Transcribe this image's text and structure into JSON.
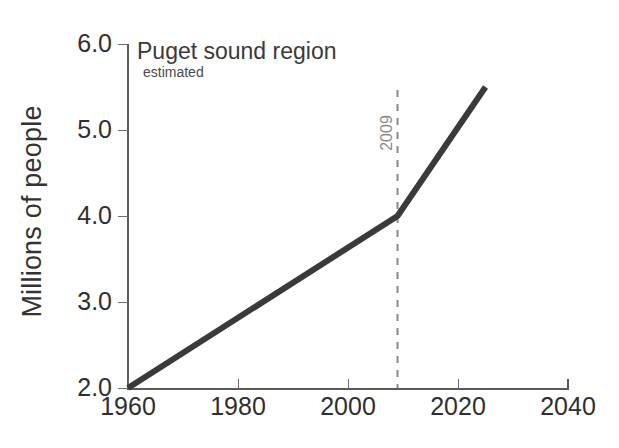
{
  "chart_data": {
    "type": "line",
    "title": "Puget sound region",
    "subtitle": "estimated",
    "xlabel": "",
    "ylabel": "Millions of people",
    "xlim": [
      1960,
      2040
    ],
    "ylim": [
      2.0,
      6.0
    ],
    "grid": false,
    "legend": null,
    "xticks": [
      1960,
      1980,
      2000,
      2020,
      2040
    ],
    "xtick_labels": [
      "1960",
      "1980",
      "2000",
      "2020",
      "2040"
    ],
    "yticks": [
      2.0,
      3.0,
      4.0,
      5.0,
      6.0
    ],
    "ytick_labels": [
      "2.0",
      "3.0",
      "4.0",
      "5.0",
      "6.0"
    ],
    "series": [
      {
        "name": "Puget sound region population",
        "color": "#3a3a3a",
        "x": [
          1960,
          2009,
          2025
        ],
        "values": [
          2.0,
          4.0,
          5.5
        ]
      }
    ],
    "annotations": [
      {
        "type": "vline",
        "label": "2009",
        "x": 2009,
        "style": "dashed",
        "color": "#8a8a8a",
        "orientation": "vertical-text"
      }
    ]
  },
  "axis": {
    "y_label_text": "Millions of people"
  }
}
